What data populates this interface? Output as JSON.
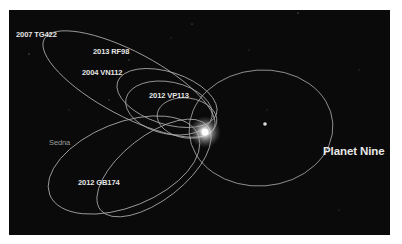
{
  "figure": {
    "labels": {
      "tg422": "2007 TG422",
      "rf98": "2013 RF98",
      "vn112": "2004 VN112",
      "vp113": "2012 VP113",
      "sedna": "Sedna",
      "gb174": "2012 GB174",
      "planet_nine": "Planet Nine"
    },
    "colors": {
      "background": "#0a0a0a",
      "orbit": "#bdbdbd",
      "label": "#e6e6e6",
      "sun_glow": "#ffffff"
    }
  }
}
